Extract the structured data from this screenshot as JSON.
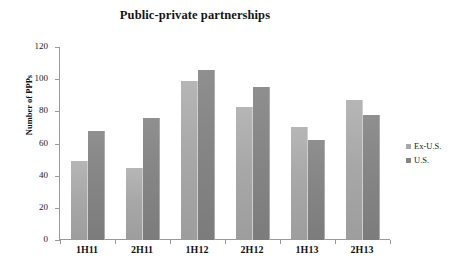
{
  "chart_data": {
    "type": "bar",
    "title": "Public-private partnerships",
    "xlabel": "",
    "ylabel": "Number of PPPs",
    "categories": [
      "1H11",
      "2H11",
      "1H12",
      "2H12",
      "1H13",
      "2H13"
    ],
    "series": [
      {
        "name": "Ex-U.S.",
        "color": "#a8a8a8",
        "values": [
          49,
          45,
          99,
          83,
          70,
          87
        ]
      },
      {
        "name": "U.S.",
        "color": "#858585",
        "values": [
          68,
          76,
          106,
          95,
          62,
          78
        ]
      }
    ],
    "ylim": [
      0,
      120
    ],
    "ytick_labels": [
      "120",
      "100",
      "80",
      "60",
      "40",
      "20",
      "0"
    ],
    "ytick_values": [
      120,
      100,
      80,
      60,
      40,
      20,
      0
    ],
    "grid": false,
    "legend_position": "right"
  }
}
